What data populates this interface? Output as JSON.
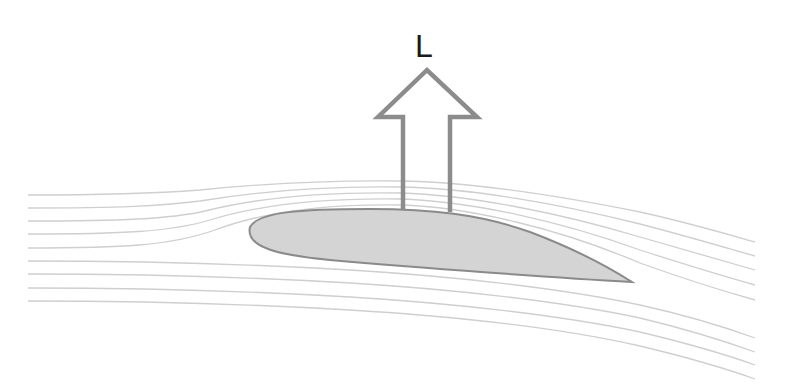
{
  "diagram": {
    "lift_label": "L",
    "colors": {
      "streamline": "#cfcfcf",
      "airfoil_fill": "#d4d4d4",
      "airfoil_stroke": "#8a8a8a",
      "arrow_stroke": "#8c8c8c",
      "label": "#1a1a1a"
    },
    "elements": [
      {
        "name": "streamlines",
        "count_upper": 5,
        "count_lower": 4
      },
      {
        "name": "airfoil",
        "description": "cambered wing cross-section"
      },
      {
        "name": "lift-arrow",
        "description": "hollow upward arrow labelled L"
      }
    ]
  }
}
